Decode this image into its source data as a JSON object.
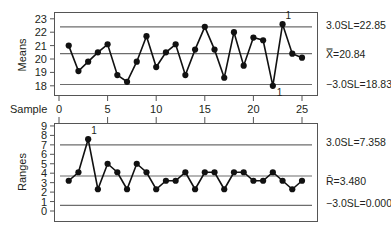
{
  "chart_data": [
    {
      "type": "line",
      "title": "Xbar chart",
      "xlabel": "Sample",
      "ylabel": "Means",
      "x": [
        1,
        2,
        3,
        4,
        5,
        6,
        7,
        8,
        9,
        10,
        11,
        12,
        13,
        14,
        15,
        16,
        17,
        18,
        19,
        20,
        21,
        22,
        23,
        24,
        25
      ],
      "values": [
        21.0,
        19.1,
        19.8,
        20.5,
        21.1,
        18.8,
        18.3,
        19.8,
        21.7,
        19.4,
        20.5,
        21.1,
        18.8,
        20.7,
        22.4,
        20.7,
        18.6,
        22.0,
        19.5,
        21.6,
        21.4,
        18.0,
        22.6,
        20.4,
        20.1
      ],
      "xticks": [
        0,
        5,
        10,
        15,
        20,
        25
      ],
      "yticks": [
        18,
        19,
        20,
        21,
        22,
        23
      ],
      "xlim": [
        0,
        26
      ],
      "ylim": [
        17.8,
        23.4
      ],
      "grid": false,
      "control_limits": {
        "ucl": {
          "label": "3.0SL=22.85",
          "value": 22.85,
          "line_y_axis": 22.4
        },
        "center": {
          "label": "X̿=20.84",
          "value": 20.84,
          "line_y_axis": 20.4
        },
        "lcl": {
          "label": "−3.0SL=18.83",
          "value": 18.83,
          "line_y_axis": 18.1
        }
      },
      "annotations": [
        {
          "x": 23,
          "text": "1",
          "position": "above"
        },
        {
          "x": 22,
          "text": "1",
          "position": "below"
        }
      ]
    },
    {
      "type": "line",
      "title": "R chart",
      "xlabel": "Sample",
      "ylabel": "Ranges",
      "x": [
        1,
        2,
        3,
        4,
        5,
        6,
        7,
        8,
        9,
        10,
        11,
        12,
        13,
        14,
        15,
        16,
        17,
        18,
        19,
        20,
        21,
        22,
        23,
        24,
        25
      ],
      "values": [
        3.2,
        4.1,
        7.6,
        2.3,
        5.0,
        4.1,
        2.3,
        5.0,
        4.1,
        2.3,
        3.2,
        3.2,
        4.1,
        2.3,
        4.1,
        4.1,
        2.3,
        4.1,
        4.1,
        3.2,
        3.2,
        4.1,
        3.2,
        2.3,
        3.2
      ],
      "xticks": [
        0,
        5,
        10,
        15,
        20,
        25
      ],
      "yticks": [
        0,
        1,
        2,
        3,
        4,
        5,
        6,
        7,
        8,
        9
      ],
      "xlim": [
        0,
        26
      ],
      "ylim": [
        -1.1,
        9.3
      ],
      "grid": false,
      "control_limits": {
        "ucl": {
          "label": "3.0SL=7.358",
          "value": 7.358,
          "line_y_axis": 7.0
        },
        "center": {
          "label": "R̄=3.480",
          "value": 3.48,
          "line_y_axis": 3.7
        },
        "lcl": {
          "label": "−3.0SL=0.000",
          "value": 0.0,
          "line_y_axis": 0.6
        }
      },
      "annotations": [
        {
          "x": 3,
          "text": "1",
          "position": "above"
        }
      ]
    }
  ],
  "labels": {
    "sample_axis": "Sample",
    "means_axis": "Means",
    "ranges_axis": "Ranges",
    "means_ucl": "3.0SL=22.85",
    "means_center": "X̿=20.84",
    "means_lcl": "−3.0SL=18.83",
    "ranges_ucl": "3.0SL=7.358",
    "ranges_center": "R̄=3.480",
    "ranges_lcl": "−3.0SL=0.000"
  }
}
